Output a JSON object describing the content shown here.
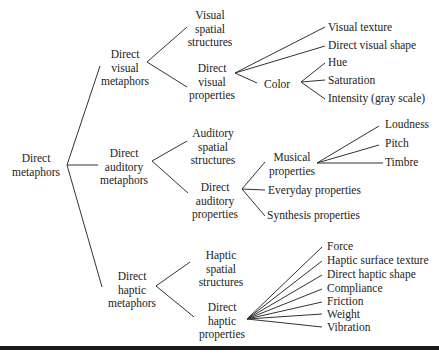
{
  "diagram": {
    "type": "tree",
    "root": "Direct metaphors",
    "nodes": {
      "root": [
        "Direct",
        "metaphors"
      ],
      "visual": [
        "Direct",
        "visual",
        "metaphors"
      ],
      "auditory": [
        "Direct",
        "auditory",
        "metaphors"
      ],
      "haptic": [
        "Direct",
        "haptic",
        "metaphors"
      ],
      "visual_spatial": [
        "Visual",
        "spatial",
        "structures"
      ],
      "visual_props": [
        "Direct",
        "visual",
        "properties"
      ],
      "auditory_spatial": [
        "Auditory",
        "spatial",
        "structures"
      ],
      "auditory_props": [
        "Direct",
        "auditory",
        "properties"
      ],
      "haptic_spatial": [
        "Haptic",
        "spatial",
        "structures"
      ],
      "haptic_props": [
        "Direct",
        "haptic",
        "properties"
      ],
      "visual_texture": "Visual texture",
      "visual_shape": "Direct visual shape",
      "color": "Color",
      "hue": "Hue",
      "saturation": "Saturation",
      "intensity": "Intensity (gray scale)",
      "musical": [
        "Musical",
        "properties"
      ],
      "everyday": "Everyday properties",
      "synthesis": "Synthesis properties",
      "loudness": "Loudness",
      "pitch": "Pitch",
      "timbre": "Timbre",
      "force": "Force",
      "haptic_texture": "Haptic surface texture",
      "haptic_shape": "Direct haptic shape",
      "compliance": "Compliance",
      "friction": "Friction",
      "weight": "Weight",
      "vibration": "Vibration"
    },
    "line_color": "#333333"
  }
}
